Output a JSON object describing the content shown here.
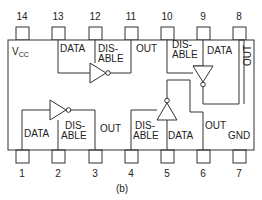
{
  "figure": {
    "caption": "(b)",
    "package": "14-pin DIP, quad tri-state inverting buffer"
  },
  "pins_top": [
    {
      "num": "14",
      "x": 22
    },
    {
      "num": "13",
      "x": 58
    },
    {
      "num": "12",
      "x": 95
    },
    {
      "num": "11",
      "x": 131
    },
    {
      "num": "10",
      "x": 167
    },
    {
      "num": "9",
      "x": 203
    },
    {
      "num": "8",
      "x": 239
    }
  ],
  "pins_bottom": [
    {
      "num": "1",
      "x": 22
    },
    {
      "num": "2",
      "x": 58
    },
    {
      "num": "3",
      "x": 95
    },
    {
      "num": "4",
      "x": 131
    },
    {
      "num": "5",
      "x": 167
    },
    {
      "num": "6",
      "x": 203
    },
    {
      "num": "7",
      "x": 239
    }
  ],
  "labels": {
    "vcc_main": "V",
    "vcc_sub": "CC",
    "gnd": "GND",
    "data": "DATA",
    "dis": "DIS-",
    "able": "ABLE",
    "out": "OUT"
  },
  "gates": [
    {
      "id": "gate-1",
      "data_pin": "1",
      "disable_pin": "2",
      "out_pin": "3"
    },
    {
      "id": "gate-2",
      "data_pin": "5",
      "disable_pin": "4",
      "out_pin": "6"
    },
    {
      "id": "gate-3",
      "data_pin": "9",
      "disable_pin": "10",
      "out_pin": "8"
    },
    {
      "id": "gate-4",
      "data_pin": "13",
      "disable_pin": "12",
      "out_pin": "11"
    }
  ]
}
